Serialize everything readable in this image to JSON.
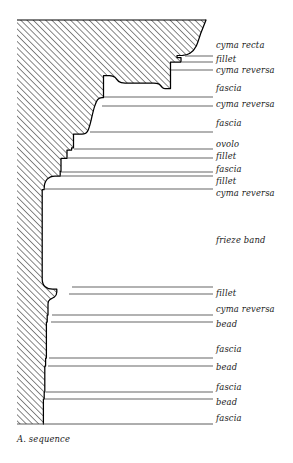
{
  "figure": {
    "title": "A. sequence",
    "caption": "A. sequence",
    "caption_x": 17,
    "caption_y": 438,
    "type": "architectural-molding-profile",
    "colors": {
      "ink": "#000000",
      "hatch": "#222222",
      "leader": "#4a4a4a",
      "background": "#ffffff"
    },
    "geometry": {
      "frame_left": 17,
      "frame_top": 20,
      "frame_right": 213,
      "frame_bottom": 424,
      "label_x": 216,
      "leader_end_x": 213
    }
  },
  "moldings": [
    {
      "name": "cyma recta",
      "label": "cyma recta",
      "label_y": 41,
      "leader": false,
      "leader_y": null,
      "leader_start_x": null
    },
    {
      "name": "fillet",
      "label": "fillet",
      "label_y": 55,
      "leader": true,
      "leader_y": 56,
      "leader_start_x": 185
    },
    {
      "name": "cyma reversa",
      "label": "cyma reversa",
      "label_y": 66,
      "leader": true,
      "leader_y": 62,
      "leader_start_x": 182
    },
    {
      "name": "fascia",
      "label": "fascia",
      "label_y": 84,
      "leader": true,
      "leader_y": 70,
      "leader_start_x": 171
    },
    {
      "name": "cyma reversa",
      "label": "cyma reversa",
      "label_y": 100,
      "leader": true,
      "leader_y": 97,
      "leader_start_x": 104
    },
    {
      "name": "fascia",
      "label": "fascia",
      "label_y": 119,
      "leader": true,
      "leader_y": 106,
      "leader_start_x": 102
    },
    {
      "name": "ovolo",
      "label": "ovolo",
      "label_y": 140,
      "leader": true,
      "leader_y": 132,
      "leader_start_x": 90
    },
    {
      "name": "fillet",
      "label": "fillet",
      "label_y": 152,
      "leader": true,
      "leader_y": 149,
      "leader_start_x": 74
    },
    {
      "name": "fascia",
      "label": "fascia",
      "label_y": 165,
      "leader": true,
      "leader_y": 158,
      "leader_start_x": 68
    },
    {
      "name": "fillet",
      "label": "fillet",
      "label_y": 177,
      "leader": true,
      "leader_y": 172,
      "leader_start_x": 61
    },
    {
      "name": "cyma reversa",
      "label": "cyma reversa",
      "label_y": 189,
      "leader": true,
      "leader_y": 176,
      "leader_start_x": 60
    },
    {
      "name": "frieze band",
      "label": "frieze band",
      "label_y": 236,
      "leader": true,
      "leader_y": 189,
      "leader_start_x": 44
    },
    {
      "name": "fillet",
      "label": "fillet",
      "label_y": 289,
      "leader": true,
      "leader_y": 287,
      "leader_start_x": 72
    },
    {
      "name": "cyma reversa",
      "label": "cyma reversa",
      "label_y": 305,
      "leader": true,
      "leader_y": 294,
      "leader_start_x": 69
    },
    {
      "name": "bead",
      "label": "bead",
      "label_y": 320,
      "leader": true,
      "leader_y": 315,
      "leader_start_x": 52
    },
    {
      "name": "fascia",
      "label": "fascia",
      "label_y": 345,
      "leader": true,
      "leader_y": 322,
      "leader_start_x": 51
    },
    {
      "name": "bead",
      "label": "bead",
      "label_y": 363,
      "leader": true,
      "leader_y": 358,
      "leader_start_x": 49
    },
    {
      "name": "fascia",
      "label": "fascia",
      "label_y": 383,
      "leader": true,
      "leader_y": 366,
      "leader_start_x": 48
    },
    {
      "name": "bead",
      "label": "bead",
      "label_y": 398,
      "leader": true,
      "leader_y": 392,
      "leader_start_x": 46
    },
    {
      "name": "fascia",
      "label": "fascia",
      "label_y": 414,
      "leader": true,
      "leader_y": 399,
      "leader_start_x": 45
    }
  ],
  "bottom_rule": {
    "y": 424,
    "x1": 17,
    "x2": 213
  }
}
